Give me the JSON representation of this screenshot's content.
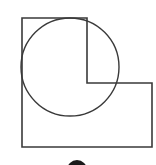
{
  "diagram": {
    "type": "geometry-figure",
    "stroke_color": "#3a3a3a",
    "fill_color": "#ffffff",
    "dot_color": "#1a1a1a",
    "polygon": {
      "points": [
        [
          22,
          18
        ],
        [
          87,
          18
        ],
        [
          87,
          83
        ],
        [
          152,
          83
        ],
        [
          152,
          147
        ],
        [
          22,
          147
        ]
      ]
    },
    "circle": {
      "cx": 70,
      "cy": 67,
      "r": 49
    },
    "bottom_dot": {
      "cx": 77,
      "cy": 170,
      "r": 10
    }
  }
}
